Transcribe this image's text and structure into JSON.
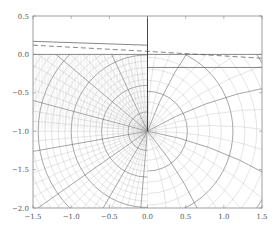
{
  "chart_data": {
    "type": "line",
    "title": "",
    "xlabel": "",
    "ylabel": "",
    "xlim": [
      -1.5,
      1.5
    ],
    "ylim": [
      -2.0,
      0.5
    ],
    "grid": false,
    "legend": null,
    "x_ticks": [
      -1.5,
      -1.0,
      -0.5,
      0.0,
      0.5,
      1.0,
      1.5
    ],
    "x_tick_labels": [
      "−1.5",
      "−1.0",
      "−0.5",
      "0.0",
      "0.5",
      "1.0",
      "1.5"
    ],
    "y_ticks": [
      0.5,
      0.0,
      -0.5,
      -1.0,
      -1.5,
      -2.0
    ],
    "y_tick_labels": [
      "0.5",
      "0.0",
      "−0.5",
      "−1.0",
      "−1.5",
      "−2.0"
    ],
    "singular_point": [
      0.0,
      -1.0
    ],
    "vertical_wall": {
      "x": 0.0,
      "y_from": 0.5,
      "y_to": -1.0
    },
    "series": [
      {
        "name": "solid surface (left)",
        "style": "solid",
        "x": [
          -1.5,
          0.0
        ],
        "y": [
          0.17,
          0.12
        ]
      },
      {
        "name": "dashed surface",
        "style": "dashed",
        "x": [
          -1.5,
          0.0,
          1.5
        ],
        "y": [
          0.12,
          0.04,
          -0.05
        ]
      },
      {
        "name": "solid surface (right)",
        "style": "solid",
        "x": [
          0.0,
          1.5
        ],
        "y": [
          -0.17,
          -0.17
        ]
      },
      {
        "name": "mesh top boundary",
        "style": "solid",
        "x": [
          -1.5,
          1.5
        ],
        "y": [
          0.0,
          0.0
        ]
      }
    ],
    "mesh": {
      "left": {
        "fine_radial_count": 40,
        "fine_angular_count": 36,
        "coarse_every": 5
      },
      "right": {
        "radial_count": 22,
        "angular_count": 18,
        "coarse_every": 4
      }
    }
  },
  "colors": {
    "axis": "#888888",
    "mesh_fine": "#b4b4b4",
    "mesh_coarse": "#6a6a6a",
    "surface": "#555555",
    "wall": "#333333"
  }
}
